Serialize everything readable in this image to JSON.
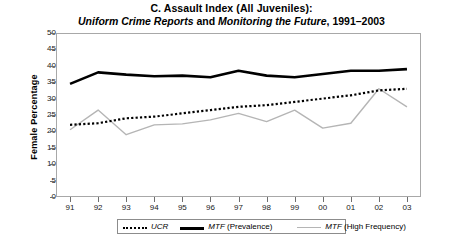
{
  "chart_data": {
    "type": "line",
    "title_line1": "C. Assault Index (All Juveniles):",
    "title_line2_part1": "Uniform Crime Reports",
    "title_line2_part2": " and ",
    "title_line2_part3": "Monitoring the Future",
    "title_line2_part4": ", 1991–2003",
    "title": "C. Assault Index (All Juveniles): Uniform Crime Reports and Monitoring the Future, 1991–2003",
    "xlabel": "",
    "ylabel": "Female Percentage",
    "categories": [
      "91",
      "92",
      "93",
      "94",
      "95",
      "96",
      "97",
      "98",
      "99",
      "00",
      "01",
      "02",
      "03"
    ],
    "x_full_years": [
      1991,
      1992,
      1993,
      1994,
      1995,
      1996,
      1997,
      1998,
      1999,
      2000,
      2001,
      2002,
      2003
    ],
    "ylim": [
      0,
      50
    ],
    "yticks": [
      0,
      5,
      10,
      15,
      20,
      25,
      30,
      35,
      40,
      45,
      50
    ],
    "grid": false,
    "legend_position": "bottom",
    "series": [
      {
        "name": "UCR",
        "name_italic": "UCR",
        "name_plain": "",
        "style": "dotted",
        "color": "#000000",
        "values": [
          22.0,
          22.5,
          24.0,
          24.5,
          25.5,
          26.5,
          27.5,
          28.0,
          29.0,
          30.0,
          31.0,
          32.5,
          33.0
        ]
      },
      {
        "name": "MTF (Prevalence)",
        "name_italic": "MTF",
        "name_plain": " (Prevalence)",
        "style": "solid-thick",
        "color": "#000000",
        "values": [
          34.5,
          38.0,
          37.3,
          36.8,
          37.0,
          36.5,
          38.5,
          37.0,
          36.5,
          37.5,
          38.5,
          38.5,
          39.0
        ]
      },
      {
        "name": "MTF (High Frequency)",
        "name_italic": "MTF",
        "name_plain": " (High Frequency)",
        "style": "solid-thin",
        "color": "#b5b5b5",
        "values": [
          20.5,
          26.5,
          19.0,
          22.0,
          22.3,
          23.5,
          25.5,
          23.0,
          26.5,
          21.0,
          22.5,
          33.0,
          27.5
        ]
      }
    ]
  },
  "legend": {
    "items": [
      {
        "label_italic": "UCR",
        "label_plain": "",
        "swatch": "dotted-black"
      },
      {
        "label_italic": "MTF",
        "label_plain": " (Prevalence)",
        "swatch": "solid-black-thick"
      },
      {
        "label_italic": "MTF",
        "label_plain": " (High Frequency)",
        "swatch": "solid-gray-thin"
      }
    ]
  }
}
